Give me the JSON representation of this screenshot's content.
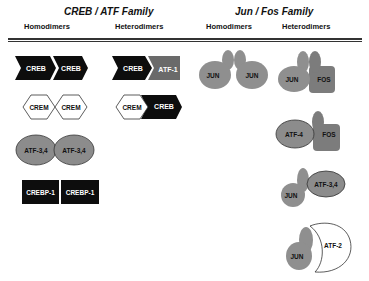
{
  "families": [
    {
      "title": "CREB / ATF Family",
      "columns": [
        "Homodimers",
        "Heterodimers"
      ],
      "homodimers": [
        {
          "shape": "chevron",
          "left": "CREB",
          "right": "CREB"
        },
        {
          "shape": "hexagon",
          "left": "CREM",
          "right": "CREM"
        },
        {
          "shape": "oval",
          "left": "ATF-3,4",
          "right": "ATF-3,4"
        },
        {
          "shape": "rectangle",
          "left": "CREBP-1",
          "right": "CREBP-1"
        }
      ],
      "heterodimers": [
        {
          "shape": "chevron",
          "left": "CREB",
          "right": "ATF-1"
        },
        {
          "shape": "hexagon-chevron",
          "left": "CREM",
          "right": "CREB"
        }
      ]
    },
    {
      "title": "Jun / Fos Family",
      "columns": [
        "Homodimers",
        "Heterodimers"
      ],
      "homodimers": [
        {
          "shape": "mitten",
          "left": "JUN",
          "right": "JUN"
        }
      ],
      "heterodimers": [
        {
          "shape": "mitten-rect",
          "left": "JUN",
          "right": "FOS"
        },
        {
          "shape": "oval-rect",
          "left": "ATF-4",
          "right": "FOS"
        },
        {
          "shape": "mitten-oval",
          "left": "JUN",
          "right": "ATF-3,4"
        },
        {
          "shape": "mitten-crescent",
          "left": "JUN",
          "right": "ATF-2"
        }
      ]
    }
  ],
  "colors": {
    "black_protein": "#0d0d0d",
    "atf1_gray": "#6a6a6a",
    "oval_gray": "#8c8c8c",
    "jun_gray": "#8f8f8f",
    "fos_gray": "#7c7c7c",
    "outline": "#333333"
  }
}
